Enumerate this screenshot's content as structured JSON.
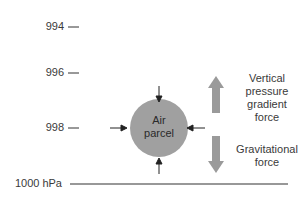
{
  "diagram": {
    "pressure_levels": [
      {
        "label": "994",
        "y": 27
      },
      {
        "label": "996",
        "y": 73
      },
      {
        "label": "998",
        "y": 128
      },
      {
        "label": "1000 hPa",
        "y": 184
      }
    ],
    "parcel": {
      "line1": "Air",
      "line2": "parcel",
      "color": "#a0a0a0"
    },
    "forces": {
      "upward": {
        "line1": "Vertical",
        "line2": "pressure",
        "line3": "gradient",
        "line4": "force"
      },
      "downward": {
        "line1": "Gravitational",
        "line2": "force"
      }
    },
    "arrow_color": "#9a9a9a"
  }
}
